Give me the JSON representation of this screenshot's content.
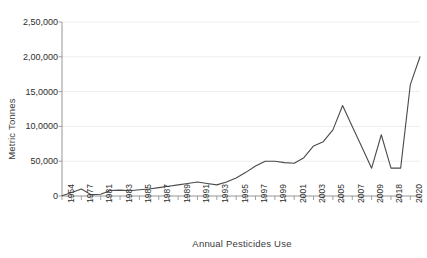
{
  "chart_data": {
    "type": "line",
    "title": "",
    "xlabel": "Annual Pesticides Use",
    "ylabel": "Metric Tonnes",
    "ylim": [
      0,
      250000
    ],
    "y_ticks": [
      0,
      50000,
      100000,
      150000,
      200000,
      250000
    ],
    "y_tick_labels": [
      "0",
      "50,000",
      "10,0000",
      "15,0000",
      "2,00,000",
      "2,50,000"
    ],
    "grid": true,
    "legend": "none",
    "x_tick_labels": [
      "1954",
      "1977",
      "1981",
      "1983",
      "1985",
      "1987",
      "1989",
      "1991",
      "1993",
      "1995",
      "1997",
      "1999",
      "2001",
      "2003",
      "2005",
      "2007",
      "2009",
      "2018",
      "2020"
    ],
    "categories": [
      "1954",
      "1976",
      "1977",
      "1980",
      "1981",
      "1982",
      "1983",
      "1984",
      "1985",
      "1986",
      "1987",
      "1988",
      "1989",
      "1990",
      "1991",
      "1992",
      "1993",
      "1994",
      "1995",
      "1996",
      "1997",
      "1998",
      "1999",
      "2000",
      "2001",
      "2002",
      "2003",
      "2004",
      "2005",
      "2006",
      "2007",
      "2008",
      "2009",
      "2010",
      "2017",
      "2018",
      "2019",
      "2020"
    ],
    "values": [
      434,
      5000,
      10000,
      2000,
      2500,
      8000,
      8500,
      7500,
      9000,
      10000,
      12000,
      14000,
      16000,
      18000,
      20000,
      18000,
      16000,
      20000,
      26000,
      34000,
      43000,
      50000,
      50000,
      48000,
      47000,
      55000,
      72000,
      78000,
      95000,
      130000,
      100000,
      70000,
      40000,
      88000,
      40000,
      40000,
      160000,
      200000
    ],
    "series_name": "Annual Pesticides Use",
    "line_color": "#4a4a4a",
    "grid_color": "#eeeeee",
    "axis_color": "#8a8a8a"
  }
}
